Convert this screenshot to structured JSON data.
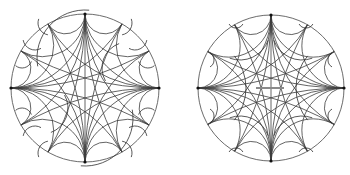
{
  "figure": {
    "colors": {
      "background": "#ffffff",
      "boundary": "#5a5a5a",
      "geodesic": "#3c3c3c",
      "detail": "#2e2e2e",
      "bar": "#8a8a8a",
      "vertex": "#111111"
    },
    "disks": [
      {
        "name": "left-disk",
        "cx": 85,
        "cy": 88,
        "r": 74,
        "vertices_deg": [
          0,
          90,
          180,
          270
        ],
        "diameter": [
          90,
          270
        ],
        "fan_offsets_deg": [
          30,
          60
        ],
        "partial_arcs": [
          {
            "cx": 85,
            "cy": 58,
            "r": 48,
            "start": 170,
            "end": 275
          },
          {
            "cx": 85,
            "cy": 118,
            "r": 48,
            "start": -10,
            "end": 95
          },
          {
            "cx": 128,
            "cy": 68,
            "r": 26,
            "start": 150,
            "end": 250
          },
          {
            "cx": 42,
            "cy": 108,
            "r": 26,
            "start": -30,
            "end": 70
          },
          {
            "cx": 50,
            "cy": 23,
            "r": 12,
            "start": 100,
            "end": 200
          },
          {
            "cx": 35,
            "cy": 38,
            "r": 12,
            "start": 60,
            "end": 170
          },
          {
            "cx": 22,
            "cy": 58,
            "r": 10,
            "start": 20,
            "end": 130
          },
          {
            "cx": 120,
            "cy": 23,
            "r": 12,
            "start": -20,
            "end": 80
          },
          {
            "cx": 135,
            "cy": 38,
            "r": 12,
            "start": 10,
            "end": 120
          },
          {
            "cx": 148,
            "cy": 58,
            "r": 10,
            "start": 50,
            "end": 160
          },
          {
            "cx": 22,
            "cy": 118,
            "r": 10,
            "start": 230,
            "end": 340
          },
          {
            "cx": 35,
            "cy": 138,
            "r": 12,
            "start": 190,
            "end": 300
          },
          {
            "cx": 50,
            "cy": 153,
            "r": 12,
            "start": 160,
            "end": 260
          },
          {
            "cx": 148,
            "cy": 118,
            "r": 10,
            "start": 200,
            "end": 310
          },
          {
            "cx": 135,
            "cy": 138,
            "r": 12,
            "start": 240,
            "end": 350
          },
          {
            "cx": 120,
            "cy": 153,
            "r": 12,
            "start": 280,
            "end": 20
          }
        ],
        "bar": null
      },
      {
        "name": "right-disk",
        "cx": 271,
        "cy": 88,
        "r": 73,
        "vertices_deg": [
          0,
          90,
          180,
          270
        ],
        "diameter": [
          90,
          270
        ],
        "fan_offsets_deg": [
          30,
          60
        ],
        "partial_arcs": [
          {
            "cx": 196,
            "cy": 88,
            "r": 50,
            "start": -40,
            "end": 40
          },
          {
            "cx": 346,
            "cy": 88,
            "r": 50,
            "start": 140,
            "end": 220
          },
          {
            "cx": 240,
            "cy": 30,
            "r": 30,
            "start": 20,
            "end": 110
          },
          {
            "cx": 302,
            "cy": 30,
            "r": 30,
            "start": 70,
            "end": 160
          },
          {
            "cx": 240,
            "cy": 146,
            "r": 30,
            "start": 250,
            "end": 340
          },
          {
            "cx": 302,
            "cy": 146,
            "r": 30,
            "start": 200,
            "end": 290
          },
          {
            "cx": 236,
            "cy": 20,
            "r": 8,
            "start": 30,
            "end": 150
          },
          {
            "cx": 306,
            "cy": 20,
            "r": 8,
            "start": 30,
            "end": 150
          },
          {
            "cx": 206,
            "cy": 60,
            "r": 8,
            "start": -60,
            "end": 60
          },
          {
            "cx": 336,
            "cy": 60,
            "r": 8,
            "start": 120,
            "end": 240
          },
          {
            "cx": 206,
            "cy": 116,
            "r": 8,
            "start": -60,
            "end": 60
          },
          {
            "cx": 336,
            "cy": 116,
            "r": 8,
            "start": 120,
            "end": 240
          },
          {
            "cx": 236,
            "cy": 156,
            "r": 8,
            "start": 210,
            "end": 330
          },
          {
            "cx": 306,
            "cy": 156,
            "r": 8,
            "start": 210,
            "end": 330
          }
        ],
        "bar": {
          "x1": 256,
          "y1": 88,
          "x2": 284,
          "y2": 88
        }
      }
    ]
  }
}
